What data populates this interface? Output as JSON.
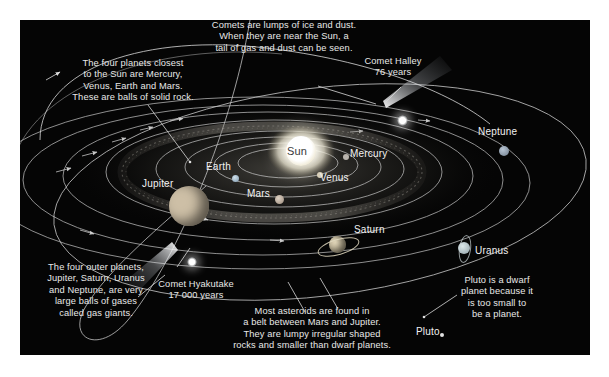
{
  "diagram": {
    "background_color": "#050505",
    "frame_color": "#ffffff",
    "text_color": "#e8e8e8",
    "orbit_color": "#c8c8c8"
  },
  "annotations": [
    {
      "name": "inner-planets-note",
      "text": "The four planets closest\nto the Sun are Mercury,\nVenus, Earth and Mars.\nThese are balls of solid rock."
    },
    {
      "name": "comets-note",
      "text": "Comets are lumps of ice and dust.\nWhen they are near the Sun, a\ntail of gas and dust can be seen."
    },
    {
      "name": "comet-halley-note",
      "text": "Comet Halley\n76 years"
    },
    {
      "name": "outer-planets-note",
      "text": "The four outer planets,\nJupiter, Saturn, Uranus\nand Neptune, are very\nlarge balls of gases\ncalled gas giants."
    },
    {
      "name": "comet-hyakutake-note",
      "text": "Comet Hyakutake\n17 000 years"
    },
    {
      "name": "asteroid-belt-note",
      "text": "Most asteroids are found in\na belt between Mars and Jupiter.\nThey are lumpy irregular shaped\nrocks and smaller than dwarf planets."
    },
    {
      "name": "pluto-note",
      "text": "Pluto is a dwarf\nplanet because it\nis too small to\nbe a planet."
    }
  ],
  "bodies": [
    {
      "name": "sun",
      "label": "Sun",
      "color": "#ffffff"
    },
    {
      "name": "mercury",
      "label": "Mercury",
      "color": "#b9b4ad"
    },
    {
      "name": "venus",
      "label": "Venus",
      "color": "#d8cfb8"
    },
    {
      "name": "earth",
      "label": "Earth",
      "color": "#9fb6c8"
    },
    {
      "name": "mars",
      "label": "Mars",
      "color": "#c0b0a0"
    },
    {
      "name": "jupiter",
      "label": "Jupiter",
      "color": "#cfc2ae"
    },
    {
      "name": "saturn",
      "label": "Saturn",
      "color": "#cbbfa4"
    },
    {
      "name": "uranus",
      "label": "Uranus",
      "color": "#c3cfd2"
    },
    {
      "name": "neptune",
      "label": "Neptune",
      "color": "#9aa6b4"
    },
    {
      "name": "pluto",
      "label": "Pluto",
      "color": "#d6d6d6"
    }
  ]
}
